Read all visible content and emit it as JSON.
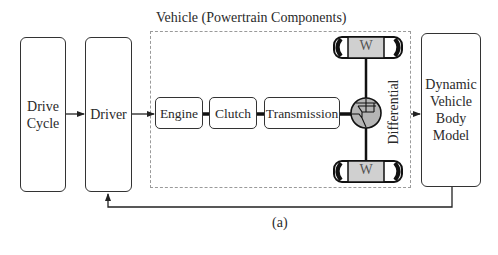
{
  "diagram": {
    "title": "Vehicle (Powertrain Components)",
    "caption": "(a)",
    "blocks": {
      "drive_cycle": "Drive Cycle",
      "driver": "Driver",
      "engine": "Engine",
      "clutch": "Clutch",
      "transmission": "Transmission",
      "differential": "Differential",
      "wheel_top": "W",
      "wheel_bottom": "W",
      "body_model": "Dynamic Vehicle Body Model"
    },
    "body_model_lines": [
      "Dynamic",
      "Vehicle",
      "Body",
      "Model"
    ],
    "drive_cycle_lines": [
      "Drive",
      "Cycle"
    ],
    "connections": [
      {
        "from": "Drive Cycle",
        "to": "Driver",
        "type": "arrow"
      },
      {
        "from": "Driver",
        "to": "Engine",
        "type": "arrow"
      },
      {
        "from": "Engine",
        "to": "Clutch",
        "type": "shaft"
      },
      {
        "from": "Clutch",
        "to": "Transmission",
        "type": "shaft"
      },
      {
        "from": "Transmission",
        "to": "Differential",
        "type": "shaft"
      },
      {
        "from": "Differential",
        "to": "W (top)",
        "type": "shaft"
      },
      {
        "from": "Differential",
        "to": "W (bottom)",
        "type": "shaft"
      },
      {
        "from": "Vehicle",
        "to": "Dynamic Vehicle Body Model",
        "type": "arrow"
      },
      {
        "from": "Dynamic Vehicle Body Model",
        "to": "Driver",
        "type": "feedback-arrow"
      }
    ],
    "colors": {
      "stroke": "#333333",
      "dashed_border": "#9a9a9a",
      "differential_fill": "#b5b5b5",
      "wheel_fill": "#d0d0d0"
    }
  }
}
